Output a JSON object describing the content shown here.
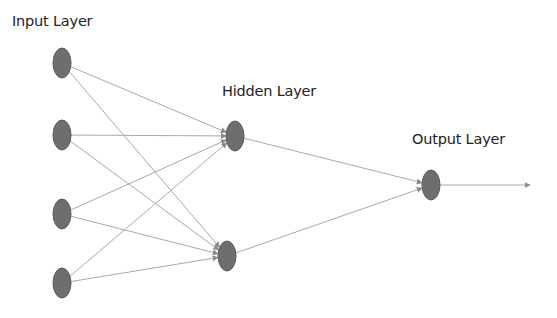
{
  "diagram": {
    "colors": {
      "node_fill": "#6e6e6e",
      "node_stroke": "#5a5a5a",
      "edge": "#a9a9a9",
      "text": "#222222"
    },
    "layers": [
      {
        "id": "input",
        "label": "Input Layer",
        "label_pos": [
          12,
          13
        ],
        "nodes": [
          {
            "id": "i1",
            "cx": 62,
            "cy": 63
          },
          {
            "id": "i2",
            "cx": 62,
            "cy": 135
          },
          {
            "id": "i3",
            "cx": 62,
            "cy": 214
          },
          {
            "id": "i4",
            "cx": 62,
            "cy": 283
          }
        ]
      },
      {
        "id": "hidden",
        "label": "Hidden Layer",
        "label_pos": [
          222,
          83
        ],
        "nodes": [
          {
            "id": "h1",
            "cx": 235,
            "cy": 136
          },
          {
            "id": "h2",
            "cx": 227,
            "cy": 256
          }
        ]
      },
      {
        "id": "output",
        "label": "Output Layer",
        "label_pos": [
          412,
          131
        ],
        "nodes": [
          {
            "id": "o1",
            "cx": 431,
            "cy": 185
          }
        ]
      }
    ],
    "edges": [
      {
        "from": "i1",
        "to": "h1"
      },
      {
        "from": "i1",
        "to": "h2"
      },
      {
        "from": "i2",
        "to": "h1"
      },
      {
        "from": "i2",
        "to": "h2"
      },
      {
        "from": "i3",
        "to": "h1"
      },
      {
        "from": "i3",
        "to": "h2"
      },
      {
        "from": "i4",
        "to": "h1"
      },
      {
        "from": "i4",
        "to": "h2"
      },
      {
        "from": "h1",
        "to": "o1"
      },
      {
        "from": "h2",
        "to": "o1"
      }
    ],
    "output_arrow": {
      "from": "o1",
      "to_x": 530,
      "to_y": 185
    },
    "node_rx": 9,
    "node_ry": 15
  }
}
